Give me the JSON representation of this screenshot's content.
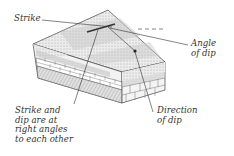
{
  "diagram": {
    "type": "geologic block diagram",
    "labels": {
      "strike": "Strike",
      "angle_of_dip_1": "Angle",
      "angle_of_dip_2": "of dip",
      "direction_of_dip_1": "Direction",
      "direction_of_dip_2": "of dip",
      "right_angles_1": "Strike and",
      "right_angles_2": "dip are at",
      "right_angles_3": "right angles",
      "right_angles_4": "to each other"
    },
    "colors": {
      "ink": "#3a3a3a",
      "stipple_light": "#e4e4e4",
      "stipple_mid": "#cfcfcf",
      "stipple_dark": "#b8b8b8",
      "background": "#ffffff"
    }
  }
}
